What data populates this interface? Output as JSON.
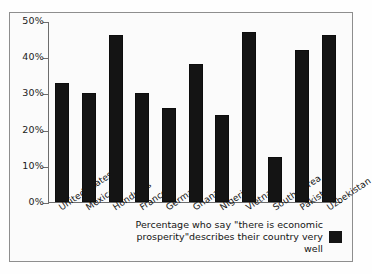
{
  "chart_data": {
    "type": "bar",
    "title": "",
    "subtitle": "",
    "xlabel": "",
    "ylabel": "",
    "ylim": [
      0,
      50
    ],
    "grid": false,
    "legend_position": "bottom-right",
    "categories": [
      "United States",
      "Mexico",
      "Honduras",
      "France",
      "Germany",
      "Ghana",
      "Nigeria",
      "Vietnam",
      "South Korea",
      "Pakistan",
      "Uzbekistan"
    ],
    "values": [
      33,
      30,
      46,
      30,
      26,
      38,
      24,
      47,
      12.5,
      42,
      46
    ],
    "series": [
      {
        "name": "Percentage who say \"there is economic prosperity\" describes their country very well",
        "color": "#141414",
        "values": [
          33,
          30,
          46,
          30,
          26,
          38,
          24,
          47,
          12.5,
          42,
          46
        ]
      }
    ],
    "y_ticks": [
      "50%",
      "40%",
      "30%",
      "20%",
      "10%",
      "0%"
    ],
    "y_tick_values": [
      50,
      40,
      30,
      20,
      10,
      0
    ],
    "legend": {
      "line1": "Percentage who say \"there is economic",
      "line2": "prosperity\"describes their country very well",
      "swatch_color": "#141414"
    }
  }
}
